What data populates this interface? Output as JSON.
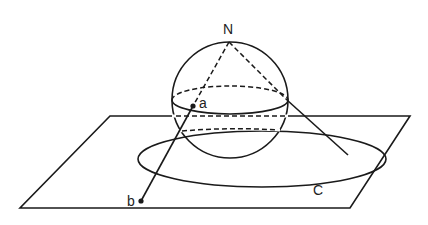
{
  "diagram": {
    "labels": {
      "north_pole": "N",
      "point_on_sphere": "a",
      "projected_point": "b",
      "circle": "C"
    },
    "colors": {
      "stroke": "#1a1a1a",
      "background": "#ffffff"
    }
  }
}
